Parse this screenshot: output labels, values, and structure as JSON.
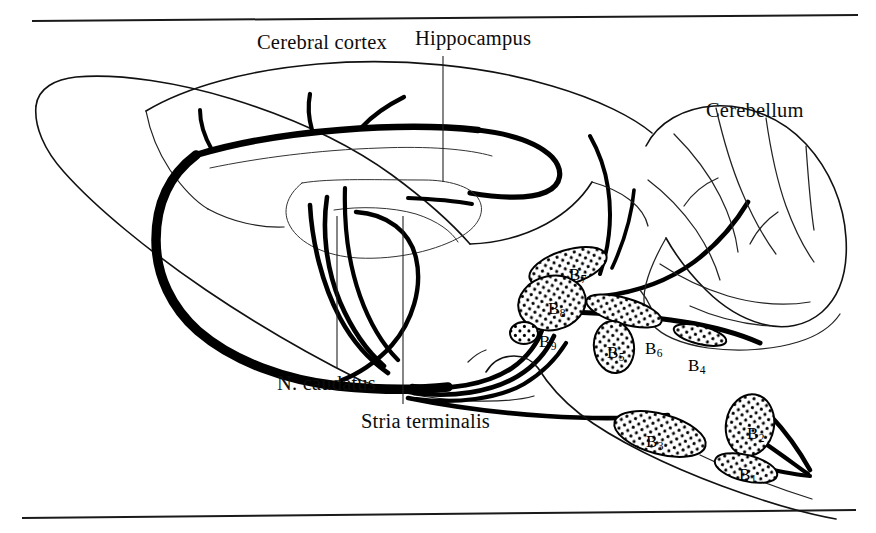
{
  "figure": {
    "background_color": "#ffffff",
    "ink_color": "#111111",
    "rules": {
      "top_rule": "horizontal rule",
      "bottom_rule": "horizontal rule"
    }
  },
  "labels": {
    "cerebral_cortex": "Cerebral cortex",
    "hippocampus": "Hippocampus",
    "cerebellum": "Cerebellum",
    "n_caudatus": "N. caudatus",
    "stria_terminalis": "Stria terminalis"
  },
  "nuclei": [
    {
      "id": "B9",
      "base": "B",
      "sub": "9",
      "x": 539,
      "y": 333,
      "note": "small round nucleus, left of B8 base"
    },
    {
      "id": "B8",
      "base": "B",
      "sub": "8",
      "x": 548,
      "y": 300,
      "note": "large oval nucleus"
    },
    {
      "id": "B7",
      "base": "B",
      "sub": "7",
      "x": 569,
      "y": 266,
      "note": "elongated nucleus above B8"
    },
    {
      "id": "B6",
      "base": "B",
      "sub": "6",
      "x": 645,
      "y": 340,
      "note": "elongated nucleus label right of B5"
    },
    {
      "id": "B5",
      "base": "B",
      "sub": "5",
      "x": 607,
      "y": 344,
      "note": "oval nucleus below B8"
    },
    {
      "id": "B4",
      "base": "B",
      "sub": "4",
      "x": 688,
      "y": 357,
      "note": "small elongated nucleus near cerebellar peduncle"
    },
    {
      "id": "B3",
      "base": "B",
      "sub": "3",
      "x": 646,
      "y": 433,
      "note": "elongated nucleus along ventral brainstem"
    },
    {
      "id": "B2",
      "base": "B",
      "sub": "2",
      "x": 747,
      "y": 425,
      "note": "rounded nucleus on caudal brainstem"
    },
    {
      "id": "B1",
      "base": "B",
      "sub": "1",
      "x": 739,
      "y": 466,
      "note": "small elongated nucleus below B2"
    }
  ],
  "leaders": [
    {
      "name": "hippocampus-leader",
      "from_label": "Hippocampus"
    },
    {
      "name": "n-caudatus-leader",
      "from_label": "N. caudatus"
    },
    {
      "name": "stria-terminalis-leader",
      "from_label": "Stria terminalis"
    }
  ]
}
